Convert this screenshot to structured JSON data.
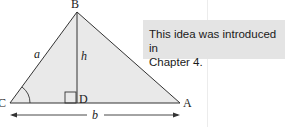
{
  "figure": {
    "vertices": {
      "B": "B",
      "C": "C",
      "A": "A",
      "D": "D"
    },
    "sides": {
      "a": "a",
      "h": "h",
      "b": "b"
    },
    "colors": {
      "fill": "#e8e8e8",
      "stroke": "#333333"
    }
  },
  "note": {
    "line1": "This idea was introduced in",
    "line2": "Chapter 4."
  }
}
